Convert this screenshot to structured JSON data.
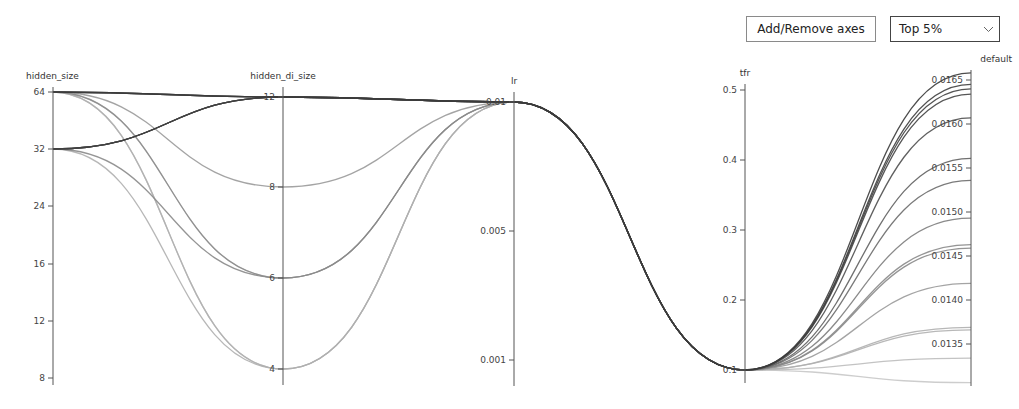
{
  "toolbar": {
    "add_remove_axes_label": "Add/Remove axes",
    "filter_select": {
      "selected": "Top 5%",
      "icon": "chevron-down-icon"
    }
  },
  "chart_data": {
    "type": "parallel_coordinates",
    "title": "",
    "axes": [
      {
        "name": "hidden_size",
        "x": 53,
        "scale": "log2",
        "ticks": [
          {
            "label": "64",
            "value": 64,
            "y": 92
          },
          {
            "label": "32",
            "value": 32,
            "y": 149
          },
          {
            "label": "24",
            "value": 24,
            "y": 206
          },
          {
            "label": "16",
            "value": 16,
            "y": 264
          },
          {
            "label": "12",
            "value": 12,
            "y": 321
          },
          {
            "label": "8",
            "value": 8,
            "y": 378
          }
        ],
        "range_y": [
          87,
          385
        ]
      },
      {
        "name": "hidden_di_size",
        "x": 283,
        "scale": "linear",
        "ticks": [
          {
            "label": "12",
            "value": 12,
            "y": 97
          },
          {
            "label": "8",
            "value": 8,
            "y": 187
          },
          {
            "label": "6",
            "value": 6,
            "y": 278
          },
          {
            "label": "4",
            "value": 4,
            "y": 369
          }
        ],
        "range_y": [
          87,
          385
        ]
      },
      {
        "name": "lr",
        "x": 514,
        "scale": "linear",
        "ticks": [
          {
            "label": "0.01",
            "value": 0.01,
            "y": 102
          },
          {
            "label": "0.005",
            "value": 0.005,
            "y": 231
          },
          {
            "label": "0.001",
            "value": 0.001,
            "y": 360
          }
        ],
        "range_y": [
          92,
          386
        ]
      },
      {
        "name": "tfr",
        "x": 745,
        "scale": "linear",
        "ticks": [
          {
            "label": "0.5",
            "value": 0.5,
            "y": 90
          },
          {
            "label": "0.4",
            "value": 0.4,
            "y": 160
          },
          {
            "label": "0.3",
            "value": 0.3,
            "y": 230
          },
          {
            "label": "0.2",
            "value": 0.2,
            "y": 300
          },
          {
            "label": "0.1",
            "value": 0.1,
            "y": 370
          }
        ],
        "range_y": [
          84,
          383
        ]
      },
      {
        "name": "default",
        "x": 971,
        "scale": "linear",
        "ticks": [
          {
            "label": "0.0165",
            "value": 0.0165,
            "y": 80
          },
          {
            "label": "0.0160",
            "value": 0.016,
            "y": 124
          },
          {
            "label": "0.0155",
            "value": 0.0155,
            "y": 168
          },
          {
            "label": "0.0150",
            "value": 0.015,
            "y": 212
          },
          {
            "label": "0.0145",
            "value": 0.0145,
            "y": 256
          },
          {
            "label": "0.0140",
            "value": 0.014,
            "y": 300
          },
          {
            "label": "0.0135",
            "value": 0.0135,
            "y": 344
          }
        ],
        "range_y": [
          70,
          386
        ]
      }
    ],
    "runs": [
      {
        "hidden_size": 64,
        "hidden_di_size": 12,
        "lr": 0.01,
        "tfr": 0.1,
        "default": 0.01658
      },
      {
        "hidden_size": 32,
        "hidden_di_size": 12,
        "lr": 0.01,
        "tfr": 0.1,
        "default": 0.01645
      },
      {
        "hidden_size": 32,
        "hidden_di_size": 12,
        "lr": 0.01,
        "tfr": 0.1,
        "default": 0.0164
      },
      {
        "hidden_size": 64,
        "hidden_di_size": 12,
        "lr": 0.01,
        "tfr": 0.1,
        "default": 0.01634
      },
      {
        "hidden_size": 32,
        "hidden_di_size": 12,
        "lr": 0.01,
        "tfr": 0.1,
        "default": 0.01607
      },
      {
        "hidden_size": 64,
        "hidden_di_size": 12,
        "lr": 0.01,
        "tfr": 0.1,
        "default": 0.01561
      },
      {
        "hidden_size": 32,
        "hidden_di_size": 12,
        "lr": 0.01,
        "tfr": 0.1,
        "default": 0.01536
      },
      {
        "hidden_size": 64,
        "hidden_di_size": 12,
        "lr": 0.01,
        "tfr": 0.1,
        "default": 0.01493
      },
      {
        "hidden_size": 64,
        "hidden_di_size": 6,
        "lr": 0.01,
        "tfr": 0.1,
        "default": 0.01463
      },
      {
        "hidden_size": 32,
        "hidden_di_size": 6,
        "lr": 0.01,
        "tfr": 0.1,
        "default": 0.01459
      },
      {
        "hidden_size": 64,
        "hidden_di_size": 8,
        "lr": 0.01,
        "tfr": 0.1,
        "default": 0.01419
      },
      {
        "hidden_size": 32,
        "hidden_di_size": 4,
        "lr": 0.01,
        "tfr": 0.1,
        "default": 0.01369
      },
      {
        "hidden_size": 64,
        "hidden_di_size": 4,
        "lr": 0.01,
        "tfr": 0.1,
        "default": 0.01366
      },
      {
        "hidden_size": 64,
        "hidden_di_size": 4,
        "lr": 0.01,
        "tfr": 0.1,
        "default": 0.01334
      },
      {
        "hidden_size": 64,
        "hidden_di_size": 6,
        "lr": 0.01,
        "tfr": 0.1,
        "default": 0.01306
      }
    ],
    "color_by": "default",
    "colors": {
      "high": "#3a3a3a",
      "low": "#c8c8c8",
      "axis": "#555555",
      "text": "#333333"
    },
    "legend": null,
    "grid": false
  }
}
